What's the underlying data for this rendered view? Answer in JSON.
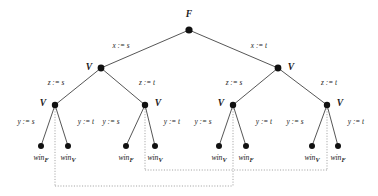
{
  "figure": {
    "name": "game-tree-diagram",
    "background_color": "#ffffff",
    "line_color": "#2b2b2b",
    "dotted_color": "#9a9a9a",
    "node_color": "#111111",
    "width": 378,
    "height": 196
  },
  "nodes": {
    "root": {
      "id": "root",
      "label": "F",
      "x": 189,
      "y": 30,
      "r": 3.6,
      "label_x": 189,
      "label_y": 17,
      "label_anchor": "middle"
    },
    "level2": [
      {
        "id": "v-L",
        "label": "V",
        "x": 101,
        "y": 68,
        "r": 3.4,
        "label_x": 89,
        "label_y": 70,
        "label_anchor": "middle"
      },
      {
        "id": "v-R",
        "label": "V",
        "x": 278,
        "y": 68,
        "r": 3.4,
        "label_x": 291,
        "label_y": 70,
        "label_anchor": "middle"
      }
    ],
    "level3": [
      {
        "id": "v-LL",
        "label": "V",
        "x": 55,
        "y": 105,
        "r": 3.2,
        "label_x": 43,
        "label_y": 106,
        "label_anchor": "middle"
      },
      {
        "id": "v-LR",
        "label": "V",
        "x": 145,
        "y": 105,
        "r": 3.2,
        "label_x": 158,
        "label_y": 106,
        "label_anchor": "middle"
      },
      {
        "id": "v-RL",
        "label": "V",
        "x": 233,
        "y": 105,
        "r": 3.2,
        "label_x": 221,
        "label_y": 106,
        "label_anchor": "middle"
      },
      {
        "id": "v-RR",
        "label": "V",
        "x": 327,
        "y": 105,
        "r": 3.2,
        "label_x": 340,
        "label_y": 106,
        "label_anchor": "middle"
      }
    ],
    "leaves": [
      {
        "id": "leaf-1",
        "base": "win",
        "sub": "F",
        "x": 41,
        "y": 146,
        "r": 3.0,
        "label_x": 41,
        "label_y": 160
      },
      {
        "id": "leaf-2",
        "base": "win",
        "sub": "V",
        "x": 68,
        "y": 146,
        "r": 3.0,
        "label_x": 68,
        "label_y": 160
      },
      {
        "id": "leaf-3",
        "base": "win",
        "sub": "F",
        "x": 126,
        "y": 146,
        "r": 3.0,
        "label_x": 126,
        "label_y": 160
      },
      {
        "id": "leaf-4",
        "base": "win",
        "sub": "V",
        "x": 155,
        "y": 146,
        "r": 3.0,
        "label_x": 155,
        "label_y": 160
      },
      {
        "id": "leaf-5",
        "base": "win",
        "sub": "V",
        "x": 219,
        "y": 146,
        "r": 3.0,
        "label_x": 219,
        "label_y": 160
      },
      {
        "id": "leaf-6",
        "base": "win",
        "sub": "F",
        "x": 246,
        "y": 146,
        "r": 3.0,
        "label_x": 246,
        "label_y": 160
      },
      {
        "id": "leaf-7",
        "base": "win",
        "sub": "V",
        "x": 312,
        "y": 146,
        "r": 3.0,
        "label_x": 312,
        "label_y": 160
      },
      {
        "id": "leaf-8",
        "base": "win",
        "sub": "F",
        "x": 338,
        "y": 146,
        "r": 3.0,
        "label_x": 338,
        "label_y": 160
      }
    ]
  },
  "edges": [
    {
      "id": "e-root-L",
      "from": "root",
      "to": "v-L",
      "x1": 189,
      "y1": 30,
      "x2": 101,
      "y2": 68,
      "label": "x := s",
      "label_x": 121,
      "label_y": 48,
      "label_anchor": "middle"
    },
    {
      "id": "e-root-R",
      "from": "root",
      "to": "v-R",
      "x1": 189,
      "y1": 30,
      "x2": 278,
      "y2": 68,
      "label": "x := t",
      "label_x": 259,
      "label_y": 48,
      "label_anchor": "middle"
    },
    {
      "id": "e-vL-LL",
      "from": "v-L",
      "to": "v-LL",
      "x1": 101,
      "y1": 68,
      "x2": 55,
      "y2": 105,
      "label": "z := s",
      "label_x": 56,
      "label_y": 85,
      "label_anchor": "middle"
    },
    {
      "id": "e-vL-LR",
      "from": "v-L",
      "to": "v-LR",
      "x1": 101,
      "y1": 68,
      "x2": 145,
      "y2": 105,
      "label": "z := t",
      "label_x": 147,
      "label_y": 85,
      "label_anchor": "middle"
    },
    {
      "id": "e-vR-RL",
      "from": "v-R",
      "to": "v-RL",
      "x1": 278,
      "y1": 68,
      "x2": 233,
      "y2": 105,
      "label": "z := s",
      "label_x": 234,
      "label_y": 85,
      "label_anchor": "middle"
    },
    {
      "id": "e-vR-RR",
      "from": "v-R",
      "to": "v-RR",
      "x1": 278,
      "y1": 68,
      "x2": 327,
      "y2": 105,
      "label": "z := t",
      "label_x": 329,
      "label_y": 85,
      "label_anchor": "middle"
    },
    {
      "id": "e-LL-1",
      "from": "v-LL",
      "to": "leaf-1",
      "x1": 55,
      "y1": 105,
      "x2": 41,
      "y2": 146,
      "label": "y := s",
      "label_x": 26,
      "label_y": 124,
      "label_anchor": "middle"
    },
    {
      "id": "e-LL-2",
      "from": "v-LL",
      "to": "leaf-2",
      "x1": 55,
      "y1": 105,
      "x2": 68,
      "y2": 146,
      "label": "y := t",
      "label_x": 86,
      "label_y": 124,
      "label_anchor": "middle"
    },
    {
      "id": "e-LR-3",
      "from": "v-LR",
      "to": "leaf-3",
      "x1": 145,
      "y1": 105,
      "x2": 126,
      "y2": 146,
      "label": "y := s",
      "label_x": 111,
      "label_y": 124,
      "label_anchor": "middle"
    },
    {
      "id": "e-LR-4",
      "from": "v-LR",
      "to": "leaf-4",
      "x1": 145,
      "y1": 105,
      "x2": 155,
      "y2": 146,
      "label": "y := t",
      "label_x": 172,
      "label_y": 124,
      "label_anchor": "middle"
    },
    {
      "id": "e-RL-5",
      "from": "v-RL",
      "to": "leaf-5",
      "x1": 233,
      "y1": 105,
      "x2": 219,
      "y2": 146,
      "label": "y := s",
      "label_x": 203,
      "label_y": 124,
      "label_anchor": "middle"
    },
    {
      "id": "e-RL-6",
      "from": "v-RL",
      "to": "leaf-6",
      "x1": 233,
      "y1": 105,
      "x2": 246,
      "y2": 146,
      "label": "y := t",
      "label_x": 264,
      "label_y": 124,
      "label_anchor": "middle"
    },
    {
      "id": "e-RR-7",
      "from": "v-RR",
      "to": "leaf-7",
      "x1": 327,
      "y1": 105,
      "x2": 312,
      "y2": 146,
      "label": "y := s",
      "label_x": 295,
      "label_y": 124,
      "label_anchor": "middle"
    },
    {
      "id": "e-RR-8",
      "from": "v-RR",
      "to": "leaf-8",
      "x1": 327,
      "y1": 105,
      "x2": 338,
      "y2": 146,
      "label": "y := t",
      "label_x": 356,
      "label_y": 124,
      "label_anchor": "middle"
    }
  ],
  "information_sets": [
    {
      "id": "iset-vertical-1",
      "orientation": "vertical",
      "x1": 55,
      "y1": 106,
      "x2": 55,
      "y2": 186
    },
    {
      "id": "iset-vertical-2",
      "orientation": "vertical",
      "x1": 145,
      "y1": 106,
      "x2": 145,
      "y2": 170
    },
    {
      "id": "iset-vertical-3",
      "orientation": "vertical",
      "x1": 233,
      "y1": 106,
      "x2": 233,
      "y2": 186
    },
    {
      "id": "iset-vertical-4",
      "orientation": "vertical",
      "x1": 327,
      "y1": 106,
      "x2": 327,
      "y2": 170
    },
    {
      "id": "iset-horizontal-1",
      "orientation": "horizontal",
      "x1": 55,
      "y1": 186,
      "x2": 233,
      "y2": 186
    },
    {
      "id": "iset-horizontal-2",
      "orientation": "horizontal",
      "x1": 145,
      "y1": 170,
      "x2": 327,
      "y2": 170
    }
  ],
  "legend": {
    "root_player": "F",
    "inner_player": "V",
    "assignment_x_left": "x := s",
    "assignment_x_right": "x := t",
    "assignment_z_left": "z := s",
    "assignment_z_right": "z := t",
    "assignment_y_left": "y := s",
    "assignment_y_right": "y := t",
    "payoff_falsifier": "win_F",
    "payoff_verifier": "win_V"
  }
}
